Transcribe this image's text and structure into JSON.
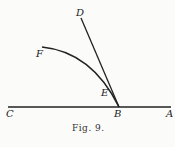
{
  "figure": {
    "caption": "Fig. 9.",
    "labels": {
      "D": "D",
      "F": "F",
      "E": "E",
      "C": "C",
      "B": "B",
      "A": "A"
    },
    "stroke_color": "#222222"
  }
}
